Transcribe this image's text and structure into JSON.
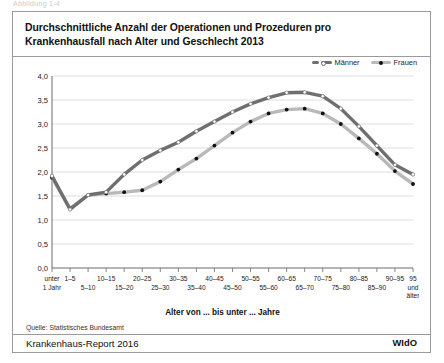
{
  "cutoff_caption": "Abbildung 1-4",
  "title": {
    "line1": "Durchschnittliche Anzahl der Operationen und Prozeduren pro",
    "line2": "Krankenhausfall nach Alter und Geschlecht 2013"
  },
  "legend": [
    {
      "label": "Männer",
      "color": "#6f6f6f"
    },
    {
      "label": "Frauen",
      "color": "#b9b9b9"
    }
  ],
  "footer": {
    "source": "Quelle: Statistisches Bundesamt",
    "report": "Krankenhaus-Report 2016",
    "publisher": "WIdO"
  },
  "chart_data": {
    "type": "line",
    "title": "Durchschnittliche Anzahl der Operationen und Prozeduren pro Krankenhausfall nach Alter und Geschlecht 2013",
    "xlabel": "Alter von ... bis unter ... Jahre",
    "ylabel": "",
    "ylim": [
      0.0,
      4.0
    ],
    "ytick_labels": [
      "0,0",
      "0,5",
      "1,0",
      "1,5",
      "2,0",
      "2,5",
      "3,0",
      "3,5",
      "4,0"
    ],
    "ytick_values": [
      0.0,
      0.5,
      1.0,
      1.5,
      2.0,
      2.5,
      3.0,
      3.5,
      4.0
    ],
    "grid": true,
    "legend_position": "top-right",
    "categories": [
      "unter 1 Jahr",
      "1–5",
      "5–10",
      "10–15",
      "15–20",
      "20–25",
      "25–30",
      "30–35",
      "35–40",
      "40–45",
      "45–50",
      "50–55",
      "55–60",
      "60–65",
      "65–70",
      "70–75",
      "75–80",
      "80–85",
      "85–90",
      "90–95",
      "95 und älter"
    ],
    "category_rows": [
      {
        "row": 1,
        "label": "unter 1 Jahr"
      },
      {
        "row": 1,
        "label": "1–5"
      },
      {
        "row": 2,
        "label": "5–10"
      },
      {
        "row": 1,
        "label": "10–15"
      },
      {
        "row": 2,
        "label": "15–20"
      },
      {
        "row": 1,
        "label": "20–25"
      },
      {
        "row": 2,
        "label": "25–30"
      },
      {
        "row": 1,
        "label": "30–35"
      },
      {
        "row": 2,
        "label": "35–40"
      },
      {
        "row": 1,
        "label": "40–45"
      },
      {
        "row": 2,
        "label": "45–50"
      },
      {
        "row": 1,
        "label": "50–55"
      },
      {
        "row": 2,
        "label": "55–60"
      },
      {
        "row": 1,
        "label": "60–65"
      },
      {
        "row": 2,
        "label": "65–70"
      },
      {
        "row": 1,
        "label": "70–75"
      },
      {
        "row": 2,
        "label": "75–80"
      },
      {
        "row": 1,
        "label": "80–85"
      },
      {
        "row": 2,
        "label": "85–90"
      },
      {
        "row": 1,
        "label": "90–95"
      },
      {
        "row": 1,
        "label": "95 und älter"
      }
    ],
    "series": [
      {
        "name": "Männer",
        "color": "#6f6f6f",
        "marker": "hollow-circle",
        "values": [
          1.92,
          1.22,
          1.52,
          1.58,
          1.95,
          2.25,
          2.45,
          2.62,
          2.85,
          3.05,
          3.25,
          3.42,
          3.55,
          3.65,
          3.66,
          3.58,
          3.32,
          2.95,
          2.55,
          2.15,
          1.95
        ]
      },
      {
        "name": "Frauen",
        "color": "#b9b9b9",
        "marker": "filled-circle",
        "values": [
          1.88,
          1.24,
          1.52,
          1.55,
          1.58,
          1.62,
          1.8,
          2.05,
          2.28,
          2.55,
          2.82,
          3.05,
          3.22,
          3.3,
          3.32,
          3.22,
          3.0,
          2.7,
          2.38,
          2.02,
          1.75
        ]
      }
    ]
  }
}
